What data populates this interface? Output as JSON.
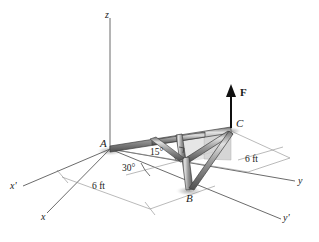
{
  "figure": {
    "background_color": "#ffffff",
    "line_color": "#555555",
    "member_color": "#8e8e8e",
    "member_highlight": "#d8d8d8",
    "member_shadow": "#5a5a5a",
    "panel_color": "#cfcfcf",
    "text_color": "#1a1a1a"
  },
  "axes": [
    {
      "name": "z-axis",
      "label": "z",
      "italic": true
    },
    {
      "name": "y-axis",
      "label": "y",
      "italic": true
    },
    {
      "name": "y-prime-axis",
      "label": "y'",
      "italic": true
    },
    {
      "name": "x-axis",
      "label": "x",
      "italic": true
    },
    {
      "name": "x-prime-axis",
      "label": "x'",
      "italic": true
    }
  ],
  "points": [
    {
      "name": "point-a",
      "label": "A"
    },
    {
      "name": "point-b",
      "label": "B"
    },
    {
      "name": "point-c",
      "label": "C"
    }
  ],
  "force": {
    "label": "F",
    "direction": "up",
    "applied_at": "C"
  },
  "angles": [
    {
      "name": "angle-15",
      "label": "15°",
      "value": 15,
      "unit": "deg"
    },
    {
      "name": "angle-30",
      "label": "30°",
      "value": 30,
      "unit": "deg"
    }
  ],
  "dimensions": [
    {
      "name": "dimension-left",
      "label": "6 ft",
      "value": 6,
      "unit": "ft"
    },
    {
      "name": "dimension-right",
      "label": "6 ft",
      "value": 6,
      "unit": "ft"
    }
  ]
}
